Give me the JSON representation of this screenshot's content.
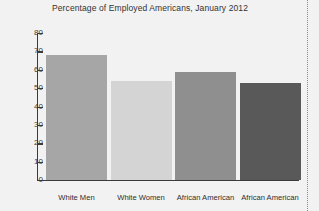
{
  "chart_data": {
    "type": "bar",
    "title": "Percentage of Employed Americans, January 2012",
    "xlabel": "",
    "ylabel": "",
    "categories": [
      "White Men",
      "White Women",
      "African American",
      "African American"
    ],
    "values": [
      68,
      54,
      59,
      53
    ],
    "ylim": [
      0,
      80
    ],
    "yticks": [
      0,
      10,
      20,
      30,
      40,
      50,
      60,
      70,
      80
    ],
    "ytick_labels": [
      "0",
      "10",
      "20",
      "30",
      "40",
      "50",
      "60",
      "70",
      "80"
    ],
    "grid": false,
    "legend": false,
    "bar_colors": [
      "#a6a6a6",
      "#d4d4d4",
      "#8f8f8f",
      "#595959"
    ],
    "background_color": "#f2f2f2",
    "axis_color": "#3b3b3b"
  },
  "decorations": {
    "right_rule_style": "dotted"
  }
}
